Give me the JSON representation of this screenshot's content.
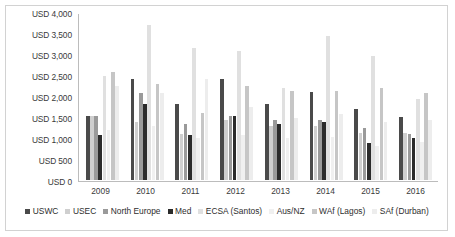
{
  "chart_data": {
    "type": "bar",
    "title": "",
    "xlabel": "",
    "ylabel": "",
    "ylim": [
      0,
      4000
    ],
    "grid": false,
    "legend_position": "bottom",
    "categories": [
      "2009",
      "2010",
      "2011",
      "2012",
      "2013",
      "2014",
      "2015",
      "2016"
    ],
    "ytick_labels": [
      "USD 4,000",
      "USD 3,500",
      "USD 3,000",
      "USD 2,500",
      "USD 2,000",
      "USD 1,500",
      "USD 1,000",
      "USD 500",
      "USD 0"
    ],
    "ytick_values": [
      4000,
      3500,
      3000,
      2500,
      2000,
      1500,
      1000,
      500,
      0
    ],
    "series": [
      {
        "name": "USWC",
        "color": "#4a4a4a",
        "values": [
          1520,
          2400,
          1800,
          2400,
          1800,
          2100,
          1700,
          1500
        ]
      },
      {
        "name": "USEC",
        "color": "#cfcfcf",
        "values": [
          1530,
          1380,
          1100,
          1430,
          1280,
          1280,
          1130,
          1120
        ]
      },
      {
        "name": "North Europe",
        "color": "#9a9a9a",
        "values": [
          1520,
          2080,
          1330,
          1530,
          1430,
          1430,
          1230,
          1100
        ]
      },
      {
        "name": "Med",
        "color": "#2b2b2b",
        "values": [
          1060,
          1810,
          1060,
          1530,
          1330,
          1380,
          880,
          1000
        ]
      },
      {
        "name": "ECSA (Santos)",
        "color": "#e0e0e0",
        "values": [
          2480,
          3700,
          3150,
          3080,
          2200,
          3430,
          2950,
          1930
        ]
      },
      {
        "name": "Aus/NZ",
        "color": "#f0f0f0",
        "values": [
          1180,
          1280,
          1000,
          1080,
          1000,
          1020,
          800,
          900
        ]
      },
      {
        "name": "WAf (Lagos)",
        "color": "#c6c6c6",
        "values": [
          2560,
          2280,
          1600,
          2250,
          2120,
          2120,
          2180,
          2080
        ]
      },
      {
        "name": "SAf (Durban)",
        "color": "#ededed",
        "values": [
          2230,
          2080,
          2400,
          1750,
          1480,
          1580,
          1380,
          1430
        ]
      }
    ]
  }
}
